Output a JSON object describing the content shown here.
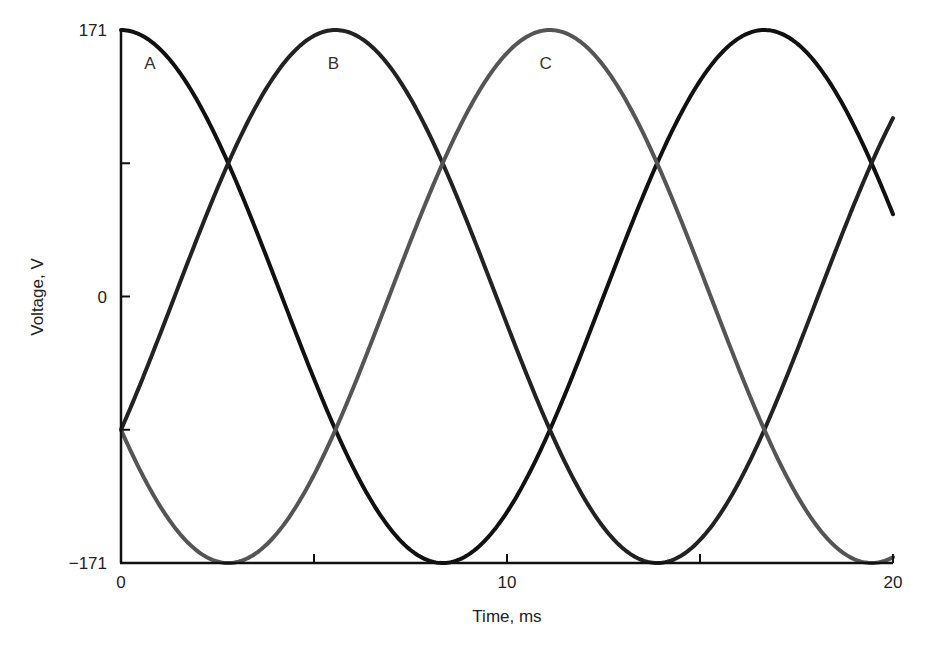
{
  "chart_data": {
    "type": "line",
    "title": "",
    "xlabel": "Time, ms",
    "ylabel": "Voltage, V",
    "xlim": [
      0,
      20
    ],
    "ylim": [
      -171,
      171
    ],
    "grid": false,
    "legend": "inline labels near curve peaks",
    "x_ticks": [
      0,
      5,
      10,
      15,
      20
    ],
    "x_tick_labels": [
      "0",
      "",
      "10",
      "",
      "20"
    ],
    "y_ticks": [
      -171,
      -85.5,
      0,
      85.5,
      171
    ],
    "y_tick_labels": [
      "−171",
      "",
      "0",
      "",
      "171"
    ],
    "frequency_hz": 60,
    "amplitude": 171,
    "series": [
      {
        "name": "A",
        "phase_deg": 0,
        "color": "#111111",
        "label_x_ms": 0.75,
        "label_y": 150,
        "x": [
          0,
          2.78,
          5.56,
          8.33,
          11.11,
          13.89,
          16.67,
          20
        ],
        "values": [
          171,
          85.5,
          -85.5,
          -171,
          -85.5,
          85.5,
          171,
          52.8
        ]
      },
      {
        "name": "B",
        "phase_deg": -120,
        "color": "#222222",
        "label_x_ms": 5.5,
        "label_y": 150,
        "x": [
          0,
          2.78,
          5.56,
          8.33,
          11.11,
          13.89,
          16.67,
          20
        ],
        "values": [
          -85.5,
          85.5,
          171,
          85.5,
          -85.5,
          -171,
          -85.5,
          114.4
        ]
      },
      {
        "name": "C",
        "phase_deg": 120,
        "color": "#555555",
        "label_x_ms": 11.0,
        "label_y": 150,
        "x": [
          0,
          2.78,
          5.56,
          8.33,
          11.11,
          13.89,
          16.67,
          20
        ],
        "values": [
          -85.5,
          -171,
          -85.5,
          85.5,
          171,
          85.5,
          -85.5,
          -167.2
        ]
      }
    ]
  }
}
